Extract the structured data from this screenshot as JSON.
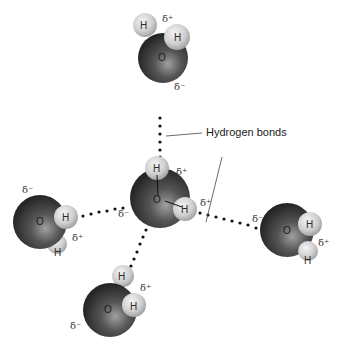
{
  "diagram": {
    "callout_label": "Hydrogen bonds",
    "atom_labels": {
      "oxygen": "O",
      "hydrogen": "H"
    },
    "charges": {
      "partial_positive": "δ⁺",
      "partial_negative": "δ⁻"
    },
    "colors": {
      "oxygen_dark": "#2b2b2b",
      "oxygen_light": "#8a8a8a",
      "hydrogen_light": "#eaeaea",
      "hydrogen_dark": "#9a9a9a",
      "bond_dots": "#111111",
      "background": "#ffffff"
    },
    "molecules": [
      {
        "id": "top",
        "position": "top",
        "charges": [
          "δ⁺",
          "δ⁻"
        ]
      },
      {
        "id": "center",
        "position": "center",
        "charges": [
          "δ⁺",
          "δ⁺",
          "δ⁻"
        ]
      },
      {
        "id": "left",
        "position": "left",
        "charges": [
          "δ⁻",
          "δ⁺"
        ]
      },
      {
        "id": "right",
        "position": "right",
        "charges": [
          "δ⁻",
          "δ⁺"
        ]
      },
      {
        "id": "bottom",
        "position": "bottom",
        "charges": [
          "δ⁺",
          "δ⁻"
        ]
      }
    ]
  }
}
